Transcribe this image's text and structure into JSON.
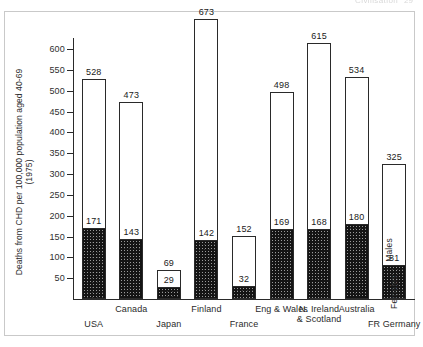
{
  "running_head": {
    "title": "Civilisation",
    "page": "29"
  },
  "chart_data": {
    "type": "bar",
    "title": "",
    "subtitle": "",
    "xlabel": "",
    "ylabel": "Deaths from CHD per 100,000 population aged 40-69 (1975)",
    "ylim": [
      0,
      600
    ],
    "yticks": [
      600,
      550,
      500,
      450,
      400,
      350,
      300,
      250,
      200,
      150,
      100,
      50
    ],
    "grid": false,
    "legend_position": "right-inside-vertical",
    "categories": [
      "USA",
      "Canada",
      "Japan",
      "Finland",
      "France",
      "Eng & Wales",
      "N. Ireland\n& Scotland",
      "Australia",
      "FR Germany"
    ],
    "series": [
      {
        "name": "Males",
        "values": [
          528,
          473,
          69,
          673,
          152,
          498,
          615,
          534,
          325
        ]
      },
      {
        "name": "Females",
        "values": [
          171,
          143,
          29,
          142,
          32,
          169,
          168,
          180,
          81
        ]
      }
    ],
    "value_labels": {
      "males": [
        "528",
        "473",
        "69",
        "673",
        "152",
        "498",
        "615",
        "534",
        "325"
      ],
      "females": [
        "171",
        "143",
        "29",
        "142",
        "32",
        "169",
        "168",
        "180",
        "81"
      ]
    },
    "colors": {
      "males_fill": "#ffffff",
      "females_fill": "#141414",
      "outline": "#2a2a2a",
      "axis": "#2a2a2a",
      "frame": "#c9c9c9"
    }
  }
}
